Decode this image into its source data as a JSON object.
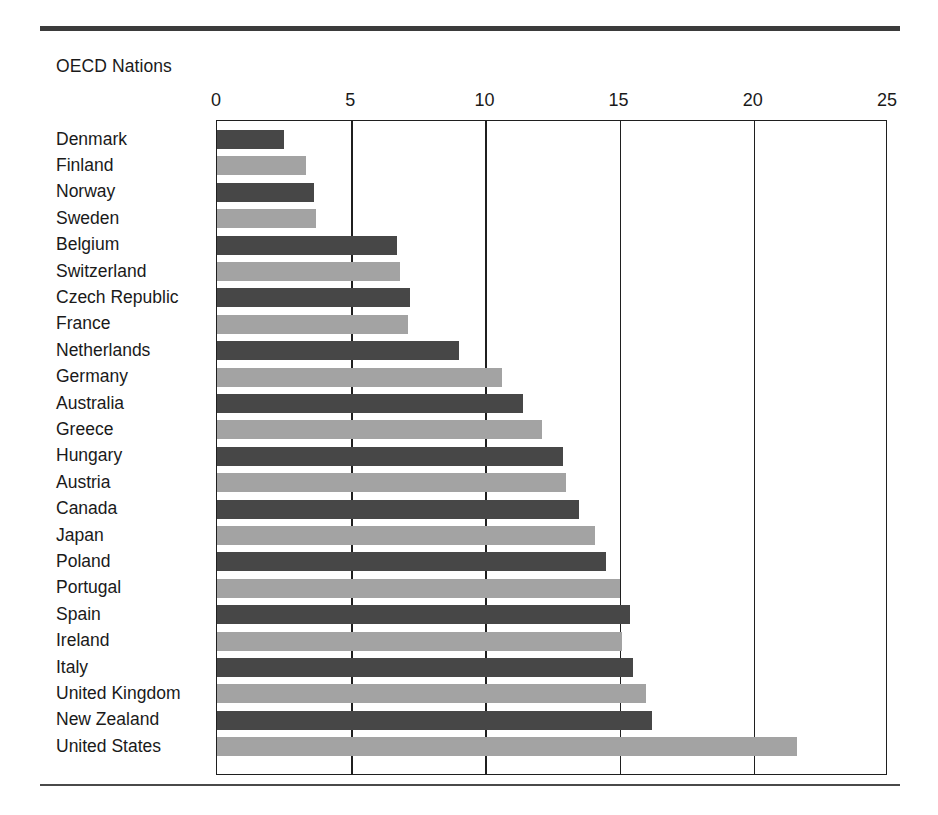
{
  "caption": "OECD Nations",
  "colors": {
    "bar_dark": "#474747",
    "bar_light": "#a3a3a3",
    "axis": "#1f1f1f",
    "rule": "#3b3b3b"
  },
  "chart_data": {
    "type": "bar",
    "orientation": "horizontal",
    "title": "OECD Nations",
    "xlabel": "",
    "ylabel": "",
    "xlim": [
      0,
      25
    ],
    "xticks": [
      0,
      5,
      10,
      15,
      20,
      25
    ],
    "xtick_labels": [
      "0",
      "5",
      "10",
      "15",
      "20",
      "25"
    ],
    "grid": true,
    "grid_axis": "x",
    "legend": false,
    "categories": [
      "Denmark",
      "Finland",
      "Norway",
      "Sweden",
      "Belgium",
      "Switzerland",
      "Czech Republic",
      "France",
      "Netherlands",
      "Germany",
      "Australia",
      "Greece",
      "Hungary",
      "Austria",
      "Canada",
      "Japan",
      "Poland",
      "Portugal",
      "Spain",
      "Ireland",
      "Italy",
      "United Kingdom",
      "New Zealand",
      "United States"
    ],
    "values": [
      2.5,
      3.3,
      3.6,
      3.7,
      6.7,
      6.8,
      7.2,
      7.1,
      9.0,
      10.6,
      11.4,
      12.1,
      12.9,
      13.0,
      13.5,
      14.1,
      14.5,
      15.0,
      15.4,
      15.1,
      15.5,
      16.0,
      16.2,
      21.6
    ],
    "bar_shades": [
      "dark",
      "light",
      "dark",
      "light",
      "dark",
      "light",
      "dark",
      "light",
      "dark",
      "light",
      "dark",
      "light",
      "dark",
      "light",
      "dark",
      "light",
      "dark",
      "light",
      "dark",
      "light",
      "dark",
      "light",
      "dark",
      "light"
    ]
  }
}
